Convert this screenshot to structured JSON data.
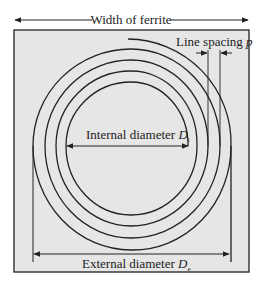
{
  "diagram": {
    "type": "planar spiral inductor on ferrite",
    "colors": {
      "background": "#ffffff",
      "ferrite_fill": "#e6e6e6",
      "line": "#222222"
    },
    "labels": {
      "width": "Width of ferrite",
      "line_spacing_text": "Line spacing ",
      "line_spacing_symbol": "p",
      "internal_text": "Internal diameter ",
      "internal_symbol": "D",
      "internal_sub": "i",
      "external_text": "External diameter ",
      "external_symbol": "D",
      "external_sub": "e"
    },
    "spiral": {
      "turns": 4,
      "center": [
        130,
        146
      ]
    }
  }
}
